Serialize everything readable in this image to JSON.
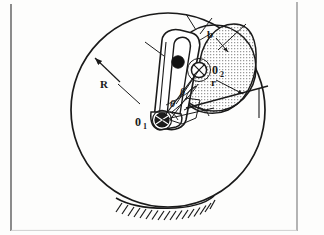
{
  "figure": {
    "background_color": "#fdfdfc",
    "ink_color": "#1a1a1a",
    "shade_color": "#b9b9b9",
    "border": {
      "left_visible": true,
      "right_visible": true,
      "bottom_visible": true,
      "top_visible": false,
      "color": "#7a7a7a"
    }
  },
  "labels": {
    "radius_big": "R",
    "pivot_one": "0",
    "pivot_one_sub": "1",
    "pivot_two": "0",
    "pivot_two_sub": "2",
    "radius_small": "r",
    "dimension_b": "b",
    "angle_beta": "β",
    "angle_theta": "θ"
  },
  "geometry": {
    "big_circle": {
      "cx": 168,
      "cy": 110,
      "r": 97
    },
    "cam_disc": {
      "cx": 213,
      "cy": 68,
      "rx": 43,
      "ry": 44
    },
    "pivot_one": {
      "x": 160,
      "y": 115
    },
    "pivot_two": {
      "x": 199,
      "y": 70
    },
    "slider_block": {
      "x": 176,
      "y": 62
    },
    "ground_hatch": {
      "y": 207,
      "x_start": 118,
      "x_end": 212,
      "ticks": 18
    }
  },
  "annotation_leaders": {
    "R_leader": {
      "from_x": 118,
      "from_y": 80,
      "to_x": 93,
      "to_y": 57
    },
    "b_leader": {
      "from_x": 215,
      "from_y": 36,
      "to_x": 225,
      "to_y": 48
    },
    "r_leader": {
      "from_x": 215,
      "from_y": 78,
      "to_x": 240,
      "to_y": 92
    }
  }
}
